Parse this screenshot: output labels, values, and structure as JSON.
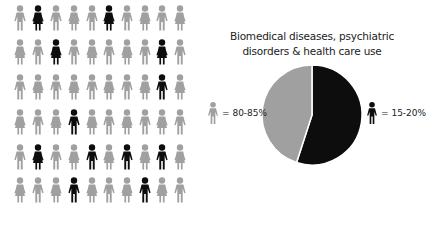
{
  "colors": {
    "majority": "#a0a0a0",
    "minority": "#0d0d0d",
    "background": "#ffffff"
  },
  "grid": {
    "rows": 6,
    "cols": 10,
    "col_x": [
      20,
      38,
      56,
      74,
      92,
      109,
      127,
      145,
      162,
      180
    ],
    "row_y": [
      18,
      52,
      87,
      122,
      157,
      190
    ],
    "highlighted": [
      [
        1,
        5
      ],
      [
        2,
        8
      ],
      [
        8
      ],
      [
        3
      ],
      [
        1,
        4,
        6,
        8
      ],
      [
        3,
        7
      ]
    ]
  },
  "chart_data": {
    "type": "pie",
    "title": "Biomedical diseases, psychiatric disorders & health care use",
    "slices": [
      {
        "label": "15-20%",
        "group": "minority (black figure)",
        "value": 55,
        "color": "#0d0d0d"
      },
      {
        "label": "80-85%",
        "group": "majority (gray figure)",
        "value": 45,
        "color": "#a0a0a0"
      }
    ],
    "legend_position": "sides"
  },
  "title": {
    "line1": "Biomedical diseases, psychiatric",
    "line2": "disorders & health care use"
  },
  "legend": {
    "gray_label": "= 80-85%",
    "black_label": "= 15-20%",
    "icon": "person-icon"
  }
}
